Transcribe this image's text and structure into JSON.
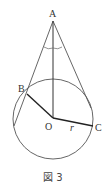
{
  "diagram": {
    "points": {
      "A": {
        "label": "A",
        "x": 53,
        "y": 20
      },
      "B": {
        "label": "B",
        "x": 27,
        "y": 94
      },
      "O": {
        "label": "O",
        "x": 53,
        "y": 118
      },
      "C": {
        "label": "C",
        "x": 93,
        "y": 126
      }
    },
    "radius_label": "r",
    "circle": {
      "cx": 53,
      "cy": 119,
      "r": 40
    },
    "caption": "図 3",
    "colors": {
      "stroke": "#444444",
      "thick": "#222222"
    }
  }
}
